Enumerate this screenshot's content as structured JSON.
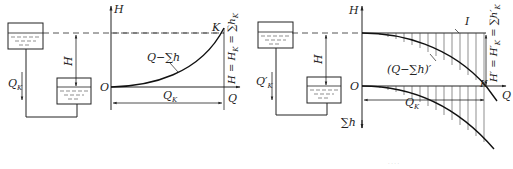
{
  "left_figure": {
    "axis_y_label": "H",
    "axis_x_label": "Q",
    "origin_label": "O",
    "point_label": "K",
    "curve_label": "Q−∑h",
    "flow_label": "Q_K",
    "flow_label_main": "Q",
    "flow_label_sub": "K",
    "head_label": "H",
    "dimension_label_main": "Q",
    "dimension_label_sub": "K",
    "vertical_relation": "H = H",
    "vertical_relation_sub": "K",
    "vertical_relation_tail": " = ∑h",
    "vertical_relation_tail_sub": "K"
  },
  "right_figure": {
    "axis_y_top_label": "H",
    "axis_y_bottom_label": "∑h",
    "axis_x_label": "Q",
    "origin_label": "O",
    "point_label": "K",
    "line_label": "I",
    "curve_label": "(Q−∑h)′",
    "flow_label_main": "Q′",
    "flow_label_sub": "K",
    "head_label": "H",
    "dimension_label_main": "Q",
    "dimension_label_sub": "K",
    "vertical_relation": "H′ = H′",
    "vertical_relation_sub": "K",
    "vertical_relation_tail": " = ∑h′",
    "vertical_relation_tail_sub": "K"
  },
  "colors": {
    "line": "#222222",
    "water_dash": "#555555",
    "hatch": "#444444"
  },
  "caption": "· · · ·"
}
